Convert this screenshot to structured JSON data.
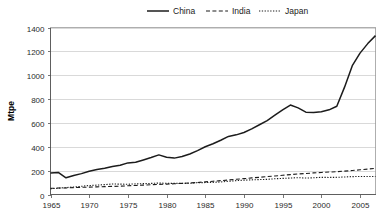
{
  "chart_data": {
    "type": "line",
    "title": "",
    "xlabel": "",
    "ylabel": "Mtpe",
    "xlim": [
      1965,
      2007
    ],
    "ylim": [
      0,
      1400
    ],
    "ytick_step": 200,
    "xtick_step": 5,
    "grid": true,
    "legend_position": "top-center",
    "yticks": [
      "0",
      "200",
      "400",
      "600",
      "800",
      "1000",
      "1200",
      "1400"
    ],
    "xticks": [
      "1965",
      "1970",
      "1975",
      "1980",
      "1985",
      "1990",
      "1995",
      "2000",
      "2005"
    ],
    "x": [
      1965,
      1966,
      1967,
      1968,
      1969,
      1970,
      1971,
      1972,
      1973,
      1974,
      1975,
      1976,
      1977,
      1978,
      1979,
      1980,
      1981,
      1982,
      1983,
      1984,
      1985,
      1986,
      1987,
      1988,
      1989,
      1990,
      1991,
      1992,
      1993,
      1994,
      1995,
      1996,
      1997,
      1998,
      1999,
      2000,
      2001,
      2002,
      2003,
      2004,
      2005,
      2006,
      2007
    ],
    "series": [
      {
        "name": "China",
        "style": "solid",
        "color": "#1c1c1c",
        "values": [
          180,
          185,
          140,
          160,
          175,
          195,
          210,
          220,
          235,
          245,
          265,
          270,
          290,
          310,
          332,
          312,
          305,
          318,
          340,
          368,
          400,
          425,
          455,
          487,
          500,
          520,
          550,
          585,
          620,
          665,
          710,
          750,
          726,
          690,
          688,
          693,
          710,
          740,
          900,
          1080,
          1185,
          1265,
          1332
        ]
      },
      {
        "name": "India",
        "style": "dashed",
        "color": "#1c1c1c",
        "values": [
          52,
          54,
          55,
          58,
          60,
          62,
          64,
          66,
          68,
          70,
          73,
          76,
          79,
          82,
          85,
          87,
          90,
          93,
          97,
          101,
          106,
          111,
          116,
          122,
          128,
          133,
          139,
          144,
          150,
          155,
          161,
          167,
          172,
          176,
          181,
          185,
          188,
          191,
          196,
          201,
          207,
          213,
          219
        ]
      },
      {
        "name": "Japan",
        "style": "dotted",
        "color": "#1c1c1c",
        "values": [
          48,
          53,
          58,
          63,
          69,
          75,
          79,
          83,
          88,
          87,
          86,
          89,
          91,
          93,
          96,
          94,
          93,
          93,
          94,
          99,
          100,
          102,
          105,
          111,
          116,
          120,
          123,
          125,
          127,
          132,
          135,
          138,
          141,
          138,
          140,
          144,
          143,
          144,
          147,
          150,
          151,
          151,
          151
        ]
      }
    ]
  },
  "legend": {
    "items": [
      {
        "label": "China",
        "style": "solid"
      },
      {
        "label": "India",
        "style": "dashed"
      },
      {
        "label": "Japan",
        "style": "dotted"
      }
    ]
  },
  "axes": {
    "y_title": "Mtpe"
  }
}
